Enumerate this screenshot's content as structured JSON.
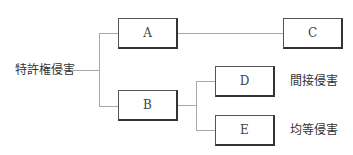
{
  "root": {
    "label": "特許権侵害"
  },
  "nodes": {
    "A": {
      "label": "A"
    },
    "B": {
      "label": "B"
    },
    "C": {
      "label": "C"
    },
    "D": {
      "label": "D",
      "annotation": "間接侵害"
    },
    "E": {
      "label": "E",
      "annotation": "均等侵害"
    }
  },
  "edges": [
    [
      "root",
      "A"
    ],
    [
      "root",
      "B"
    ],
    [
      "A",
      "C"
    ],
    [
      "B",
      "D"
    ],
    [
      "B",
      "E"
    ]
  ],
  "colors": {
    "line": "#a8a8a8",
    "box_border": "#333333",
    "text": "#333333"
  }
}
